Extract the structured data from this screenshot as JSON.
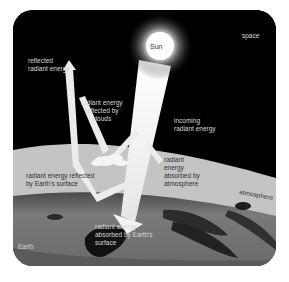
{
  "diagram": {
    "type": "earth-radiant-energy-budget",
    "colors": {
      "space": "#000000",
      "atmosphere": "#c4c4c4",
      "earth": "#6e6e6e",
      "arrow": "#f0f0f0",
      "sun": "#ffffff"
    },
    "labels": {
      "space": "space",
      "sun": "Sun",
      "incoming": "incoming\nradiant energy",
      "reflected": "reflected\nradiant energy",
      "reflected_by_clouds": "radiant energy\nreflected by\nclouds",
      "absorbed_by_atmosphere": "radiant\nenergy\nabsorbed by\natmosphere",
      "atmosphere": "atmosphere",
      "reflected_by_surface": "radiant energy reflected\nby Earth's surface",
      "absorbed_by_surface": "radiant energy\nabsorbed by Earth's\nsurface",
      "earth": "Earth"
    },
    "regions": [
      "space",
      "atmosphere",
      "Earth"
    ],
    "flows": [
      {
        "name": "incoming radiant energy",
        "from": "Sun",
        "to": "Earth's surface"
      },
      {
        "name": "radiant energy reflected by clouds",
        "from": "clouds",
        "to": "space"
      },
      {
        "name": "radiant energy absorbed by atmosphere",
        "from": "incoming beam",
        "to": "atmosphere"
      },
      {
        "name": "radiant energy reflected by Earth's surface",
        "from": "Earth's surface",
        "to": "space"
      },
      {
        "name": "radiant energy absorbed by Earth's surface",
        "from": "incoming beam",
        "to": "Earth's surface"
      }
    ]
  }
}
